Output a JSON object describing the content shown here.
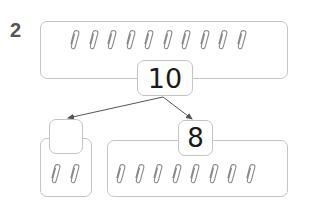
{
  "problem": {
    "number": "2"
  },
  "whole": {
    "value": "10",
    "paperclip_count": 10
  },
  "parts": [
    {
      "value": "",
      "paperclip_count": 2,
      "blank": true
    },
    {
      "value": "8",
      "paperclip_count": 8,
      "blank": false
    }
  ],
  "icons": {
    "item": "paperclip-icon",
    "connector": "arrow-icon"
  },
  "colors": {
    "stroke": "#c4c4c4",
    "text": "#1a1a1a",
    "label": "#555555",
    "arrow": "#555555"
  }
}
